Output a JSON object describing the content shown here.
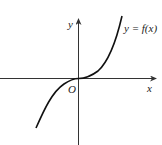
{
  "diagram": {
    "axes": {
      "x_label": "x",
      "y_label": "y",
      "origin_label": "O"
    },
    "curve_label": "y = f(x)",
    "curve_shape": "cubic-like increasing curve through origin, flat at origin",
    "colors": {
      "axis": "#333333",
      "curve": "#111111",
      "background": "#ffffff"
    }
  }
}
